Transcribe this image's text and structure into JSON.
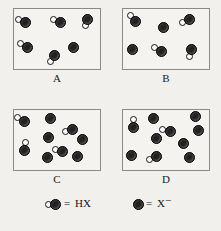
{
  "figure": {
    "background_color": "#f1f0ed",
    "panel_border_color": "#8a8a8a",
    "anion_color": "#231f20",
    "hydrogen_color": "#fbfbf9"
  },
  "panels": [
    {
      "id": "A",
      "label": "A",
      "box": {
        "x": 13,
        "y": 8,
        "w": 88,
        "h": 62
      },
      "molecule_count": 5,
      "anion_count": 1,
      "molecules": [
        {
          "x": 11,
          "y": 13,
          "angle": 200
        },
        {
          "x": 46,
          "y": 13,
          "angle": 200
        },
        {
          "x": 73,
          "y": 10,
          "angle": 105
        },
        {
          "x": 13,
          "y": 38,
          "angle": 205
        },
        {
          "x": 40,
          "y": 46,
          "angle": 115
        }
      ],
      "anions": [
        {
          "x": 59,
          "y": 38
        }
      ]
    },
    {
      "id": "B",
      "label": "B",
      "box": {
        "x": 122,
        "y": 8,
        "w": 88,
        "h": 62
      },
      "molecule_count": 4,
      "anion_count": 2,
      "molecules": [
        {
          "x": 12,
          "y": 12,
          "angle": 228
        },
        {
          "x": 66,
          "y": 10,
          "angle": 148
        },
        {
          "x": 38,
          "y": 42,
          "angle": 205
        },
        {
          "x": 68,
          "y": 40,
          "angle": 100
        }
      ],
      "anions": [
        {
          "x": 40,
          "y": 18
        },
        {
          "x": 9,
          "y": 40
        }
      ]
    },
    {
      "id": "C",
      "label": "C",
      "box": {
        "x": 13,
        "y": 109,
        "w": 88,
        "h": 62
      },
      "molecule_count": 4,
      "anion_count": 5,
      "molecules": [
        {
          "x": 10,
          "y": 11,
          "angle": 205
        },
        {
          "x": 58,
          "y": 19,
          "angle": 160
        },
        {
          "x": 10,
          "y": 40,
          "angle": 280
        },
        {
          "x": 48,
          "y": 41,
          "angle": 195
        }
      ],
      "anions": [
        {
          "x": 36,
          "y": 8
        },
        {
          "x": 34,
          "y": 27
        },
        {
          "x": 68,
          "y": 29
        },
        {
          "x": 33,
          "y": 47
        },
        {
          "x": 63,
          "y": 46
        }
      ]
    },
    {
      "id": "D",
      "label": "D",
      "box": {
        "x": 122,
        "y": 109,
        "w": 88,
        "h": 62
      },
      "molecule_count": 3,
      "anion_count": 7,
      "molecules": [
        {
          "x": 10,
          "y": 17,
          "angle": 270
        },
        {
          "x": 47,
          "y": 21,
          "angle": 190
        },
        {
          "x": 33,
          "y": 46,
          "angle": 155
        }
      ],
      "anions": [
        {
          "x": 30,
          "y": 8
        },
        {
          "x": 72,
          "y": 6
        },
        {
          "x": 33,
          "y": 28
        },
        {
          "x": 60,
          "y": 33
        },
        {
          "x": 8,
          "y": 45
        },
        {
          "x": 66,
          "y": 47
        },
        {
          "x": 75,
          "y": 20
        }
      ]
    }
  ],
  "legend": {
    "items": [
      {
        "glyph": "hx-molecule-glyph",
        "equals": "=",
        "label": "HX",
        "x": 44
      },
      {
        "glyph": "x-anion-glyph",
        "equals": "=",
        "label": "X",
        "superscript": "−",
        "x": 132
      }
    ]
  }
}
